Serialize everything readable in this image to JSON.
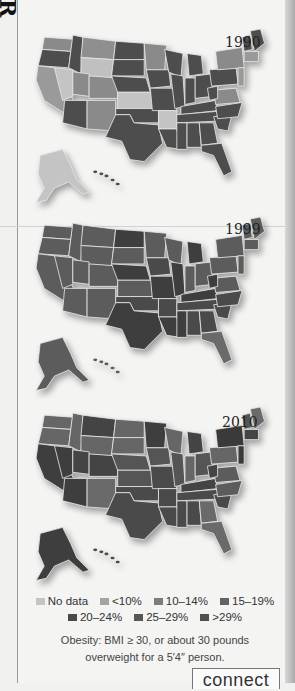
{
  "page": {
    "edge_glyph": "R",
    "connect_tab": "connect"
  },
  "legend": {
    "items": [
      {
        "label": "No data",
        "color": "#c4c4c4"
      },
      {
        "label": "<10%",
        "color": "#a3a3a3"
      },
      {
        "label": "10–14%",
        "color": "#7c7c7c"
      },
      {
        "label": "15–19%",
        "color": "#636363"
      },
      {
        "label": "20–24%",
        "color": "#4a4a4a"
      },
      {
        "label": "25–29%",
        "color": "#575757"
      },
      {
        "label": ">29%",
        "color": "#505050"
      }
    ]
  },
  "caption": {
    "line1": "Obesity: BMI ≥ 30, or about 30 pounds",
    "line2": "overweight for a 5′4″ person."
  },
  "maps": [
    {
      "year": "1990",
      "top": 25
    },
    {
      "year": "1999",
      "top": 213
    },
    {
      "year": "2010",
      "top": 403
    }
  ],
  "chart_data": {
    "type": "choropleth",
    "panels": [
      "1990",
      "1999",
      "2010"
    ],
    "legend": [
      "No data",
      "<10%",
      "10–14%",
      "15–19%",
      "20–24%",
      "25–29%",
      ">29%"
    ],
    "annotation": "Obesity: BMI ≥ 30, or about 30 pounds overweight for a 5′4″ person."
  }
}
